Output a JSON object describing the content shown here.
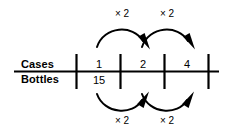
{
  "diagram": {
    "type": "double-number-line",
    "rows": [
      {
        "label": "Cases",
        "values": [
          "1",
          "2",
          "4"
        ]
      },
      {
        "label": "Bottles",
        "values": [
          "15",
          "",
          ""
        ]
      }
    ],
    "ticks": 4,
    "top_operations": [
      {
        "label": "× 2",
        "from": "1",
        "to": "2"
      },
      {
        "label": "× 2",
        "from": "2",
        "to": "4"
      }
    ],
    "bottom_operations": [
      {
        "label": "× 2",
        "from": "15",
        "to": ""
      },
      {
        "label": "× 2",
        "from": "",
        "to": ""
      }
    ],
    "colors": {
      "ink": "#000000",
      "background": "#ffffff"
    }
  }
}
